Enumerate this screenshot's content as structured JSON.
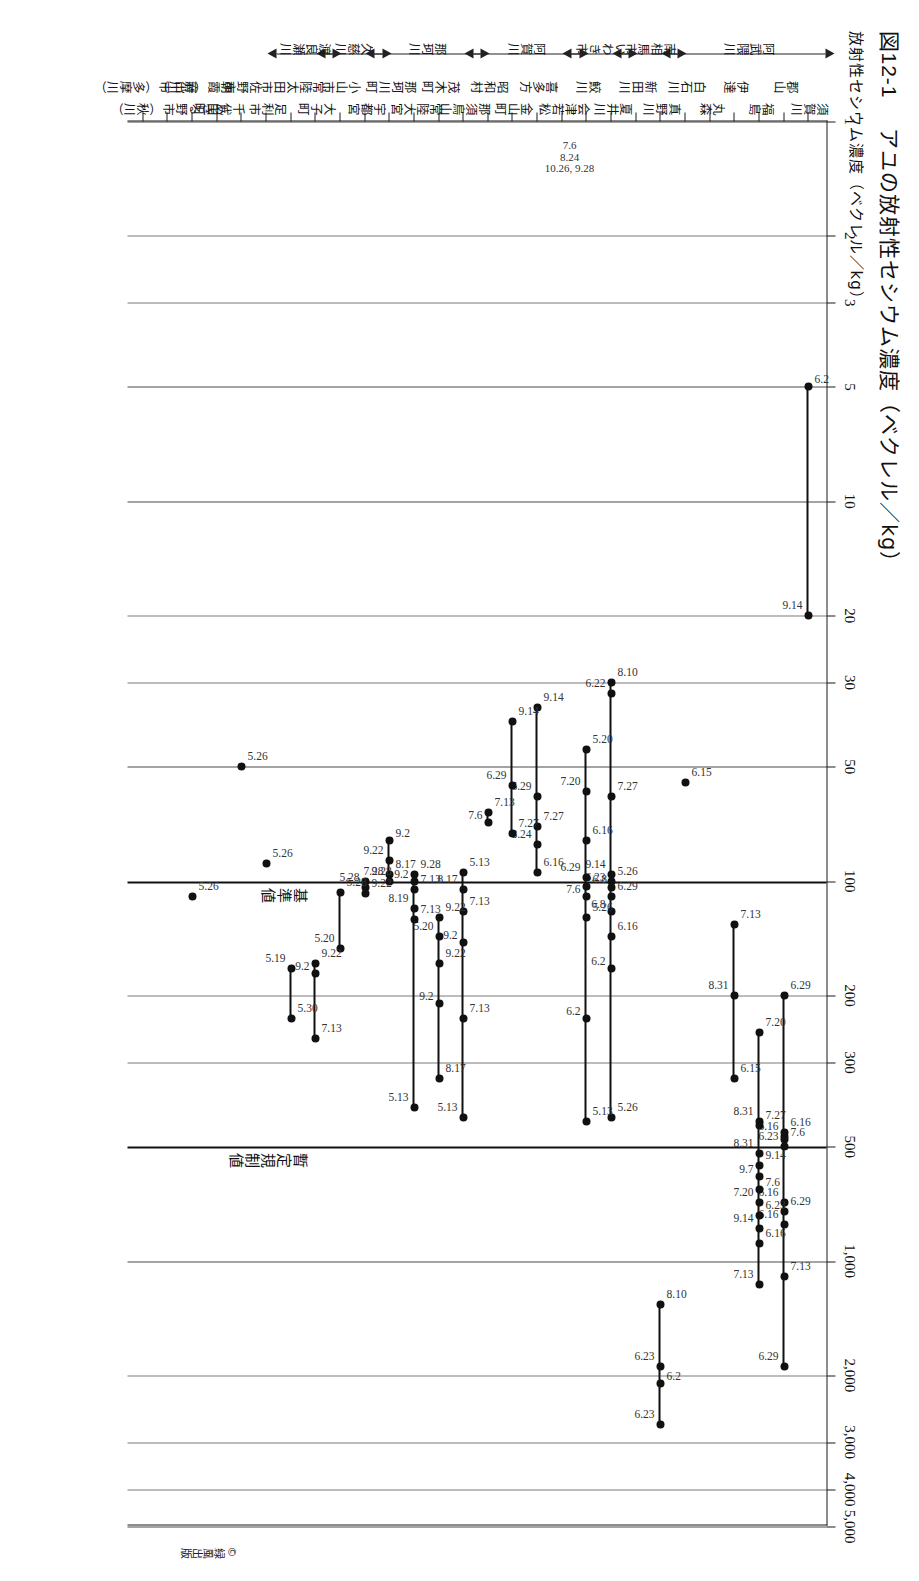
{
  "figure": {
    "number": "図12-1",
    "title": "アユの放射性セシウム濃度（ベクレル／kg）",
    "axis_caption": "放射性セシウム濃度（ベクレル／kg）",
    "credit": "©緑風出版"
  },
  "thresholds": [
    {
      "label": "暫定規制値",
      "value": 500
    },
    {
      "label": "基準値",
      "value": 100
    }
  ],
  "note_cluster": {
    "lines": [
      "7.6",
      "8.24",
      "10.26, 9.28"
    ],
    "row": 10
  },
  "chart_data": {
    "type": "scatter",
    "title": "アユの放射性セシウム濃度（ベクレル／kg）",
    "xlabel": "放射性セシウム濃度（ベクレル／kg）",
    "ylabel": "採取地点",
    "xscale": "log",
    "xlim": [
      1,
      5000
    ],
    "xticks": [
      1,
      2,
      3,
      5,
      10,
      20,
      30,
      50,
      100,
      200,
      300,
      500,
      1000,
      2000,
      3000,
      4000,
      5000
    ],
    "xticklabels": [
      "1",
      "2",
      "3",
      "5",
      "10",
      "20",
      "30",
      "50",
      "100",
      "200",
      "300",
      "500",
      "1,000",
      "2,000",
      "3,000",
      "4,000",
      "5,000"
    ],
    "grid": true,
    "legend": "none",
    "reference_lines": [
      {
        "label": "暫定規制値",
        "value": 500
      },
      {
        "label": "基準値",
        "value": 100
      }
    ],
    "rivers": [
      {
        "name": "阿武隈川",
        "arrow_start": "up",
        "arrow_end": "down",
        "rows": [
          0,
          5
        ]
      },
      {
        "name": "南相馬市",
        "arrow_start": "up",
        "arrow_end": "down",
        "rows": [
          6,
          7
        ]
      },
      {
        "name": "いわき市",
        "arrow_start": "up",
        "arrow_end": "down",
        "rows": [
          8,
          9
        ]
      },
      {
        "name": "阿賀川",
        "arrow_start": "up",
        "arrow_end": "down",
        "rows": [
          10,
          13
        ]
      },
      {
        "name": "那珂川",
        "arrow_start": "up",
        "arrow_end": "down",
        "rows": [
          14,
          17
        ]
      },
      {
        "name": "久慈川",
        "arrow_start": "up",
        "arrow_end": "down",
        "rows": [
          18,
          19
        ]
      },
      {
        "name": "渡良瀬川",
        "arrow_start": "up",
        "arrow_end": "down",
        "rows": [
          20,
          21
        ]
      }
    ],
    "rows": [
      {
        "site": "須賀川",
        "points": [
          {
            "v": 5,
            "label": "6.2"
          },
          {
            "v": 20,
            "label": "9.14"
          }
        ]
      },
      {
        "site": "郡山",
        "points": [
          {
            "v": 200,
            "label": "6.29"
          },
          {
            "v": 500,
            "label": "6.23"
          },
          {
            "v": 480,
            "label": "7.6"
          },
          {
            "v": 470,
            "label": "6.16"
          },
          {
            "v": 460,
            "label": "6.16"
          },
          {
            "v": 700,
            "label": "6.16"
          },
          {
            "v": 740,
            "label": "6.29"
          },
          {
            "v": 800,
            "label": "6.16"
          },
          {
            "v": 1100,
            "label": "7.13"
          },
          {
            "v": 1900,
            "label": "6.29"
          }
        ]
      },
      {
        "site": "福島",
        "points": [
          {
            "v": 250,
            "label": "7.20"
          },
          {
            "v": 430,
            "label": "8.31"
          },
          {
            "v": 440,
            "label": "7.27"
          },
          {
            "v": 520,
            "label": "8.31"
          },
          {
            "v": 560,
            "label": "9.14"
          },
          {
            "v": 600,
            "label": "9.7"
          },
          {
            "v": 650,
            "label": "7.6"
          },
          {
            "v": 700,
            "label": "7.20"
          },
          {
            "v": 760,
            "label": "6.23"
          },
          {
            "v": 820,
            "label": "9.14"
          },
          {
            "v": 900,
            "label": "6.16"
          },
          {
            "v": 1150,
            "label": "7.13"
          }
        ]
      },
      {
        "site": "伊達",
        "points": [
          {
            "v": 130,
            "label": "7.13"
          },
          {
            "v": 200,
            "label": "8.31"
          },
          {
            "v": 330,
            "label": "6.15"
          }
        ]
      },
      {
        "site": "丸森",
        "points": []
      },
      {
        "site": "白石川",
        "points": [
          {
            "v": 55,
            "label": "6.15"
          }
        ]
      },
      {
        "site": "真野川",
        "points": [
          {
            "v": 1300,
            "label": "8.10"
          },
          {
            "v": 1900,
            "label": "6.23"
          },
          {
            "v": 2100,
            "label": "6.2"
          },
          {
            "v": 2700,
            "label": "6.23"
          }
        ]
      },
      {
        "site": "新田川",
        "points": []
      },
      {
        "site": "夏井川",
        "points": [
          {
            "v": 30,
            "label": "8.10"
          },
          {
            "v": 32,
            "label": "6.22"
          },
          {
            "v": 60,
            "label": "7.27"
          },
          {
            "v": 96,
            "label": "9.14"
          },
          {
            "v": 100,
            "label": "5.26"
          },
          {
            "v": 104,
            "label": "6.23"
          },
          {
            "v": 110,
            "label": "6.29"
          },
          {
            "v": 120,
            "label": "6.8"
          },
          {
            "v": 140,
            "label": "6.16"
          },
          {
            "v": 170,
            "label": "6.2"
          },
          {
            "v": 420,
            "label": "5.26"
          }
        ]
      },
      {
        "site": "鮫川",
        "points": [
          {
            "v": 45,
            "label": "5.20"
          },
          {
            "v": 58,
            "label": "7.20"
          },
          {
            "v": 78,
            "label": "6.16"
          },
          {
            "v": 98,
            "label": "6.29"
          },
          {
            "v": 103,
            "label": "6.8"
          },
          {
            "v": 110,
            "label": "7.6"
          },
          {
            "v": 125,
            "label": "5.26"
          },
          {
            "v": 230,
            "label": "6.2"
          },
          {
            "v": 430,
            "label": "5.13"
          }
        ]
      },
      {
        "site": "会津若松",
        "points": []
      },
      {
        "site": "喜多方",
        "points": [
          {
            "v": 35,
            "label": "9.14"
          },
          {
            "v": 60,
            "label": "6.29"
          },
          {
            "v": 72,
            "label": "7.27"
          },
          {
            "v": 80,
            "label": "8.24"
          },
          {
            "v": 95,
            "label": "6.16"
          }
        ]
      },
      {
        "site": "金山町",
        "points": [
          {
            "v": 38,
            "label": "9.14"
          },
          {
            "v": 56,
            "label": "6.29"
          },
          {
            "v": 75,
            "label": "7.27"
          }
        ]
      },
      {
        "site": "昭和村",
        "points": [
          {
            "v": 66,
            "label": "7.13"
          },
          {
            "v": 70,
            "label": "7.6"
          }
        ]
      },
      {
        "site": "那須烏山",
        "points": [
          {
            "v": 95,
            "label": "5.13"
          },
          {
            "v": 105,
            "label": "8.17"
          },
          {
            "v": 120,
            "label": "7.13"
          },
          {
            "v": 145,
            "label": "9.2"
          },
          {
            "v": 230,
            "label": "7.13"
          },
          {
            "v": 420,
            "label": "5.13"
          }
        ]
      },
      {
        "site": "茂木町",
        "points": [
          {
            "v": 125,
            "label": "9.22"
          },
          {
            "v": 140,
            "label": "5.20"
          },
          {
            "v": 165,
            "label": "9.22"
          },
          {
            "v": 210,
            "label": "9.2"
          },
          {
            "v": 330,
            "label": "8.17"
          }
        ]
      },
      {
        "site": "常陸大宮",
        "points": [
          {
            "v": 96,
            "label": "9.28"
          },
          {
            "v": 100,
            "label": "9.2"
          },
          {
            "v": 105,
            "label": "7.13"
          },
          {
            "v": 118,
            "label": "8.19"
          },
          {
            "v": 126,
            "label": "7.13"
          },
          {
            "v": 395,
            "label": "5.13"
          }
        ]
      },
      {
        "site": "那珂川町",
        "points": [
          {
            "v": 78,
            "label": "9.2"
          },
          {
            "v": 88,
            "label": "9.22"
          },
          {
            "v": 96,
            "label": "8.17"
          },
          {
            "v": 100,
            "label": "7.28"
          }
        ]
      },
      {
        "site": "宇都宮",
        "points": [
          {
            "v": 100,
            "label": "9.28"
          },
          {
            "v": 104,
            "label": "5.28"
          },
          {
            "v": 108,
            "label": "9.22"
          }
        ]
      },
      {
        "site": "小山市",
        "points": [
          {
            "v": 107,
            "label": "5.28"
          },
          {
            "v": 150,
            "label": "5.20"
          }
        ]
      },
      {
        "site": "大子町",
        "points": [
          {
            "v": 165,
            "label": "9.22"
          },
          {
            "v": 175,
            "label": "9.2"
          },
          {
            "v": 260,
            "label": "7.13"
          }
        ]
      },
      {
        "site": "常陸太田市",
        "points": [
          {
            "v": 230,
            "label": "5.30"
          },
          {
            "v": 170,
            "label": "5.19"
          }
        ]
      },
      {
        "site": "足利市",
        "points": [
          {
            "v": 90,
            "label": "5.26"
          }
        ]
      },
      {
        "site": "佐野市",
        "points": [
          {
            "v": 50,
            "label": "5.26"
          }
        ]
      },
      {
        "site": "千代田町",
        "points": []
      },
      {
        "site": "朝霞（荒川）",
        "points": [
          {
            "v": 110,
            "label": "5.26"
          }
        ]
      },
      {
        "site": "あきる野市（秋川）",
        "points": []
      },
      {
        "site": "府中市（多摩川）",
        "points": []
      }
    ]
  }
}
